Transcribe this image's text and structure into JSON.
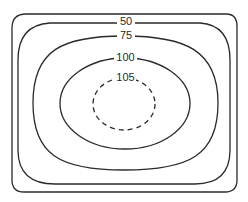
{
  "diagram": {
    "type": "contour-map",
    "frame": {
      "shape": "rounded-rectangle"
    },
    "contours": [
      {
        "value": 50,
        "label": "50",
        "style": "solid"
      },
      {
        "value": 75,
        "label": "75",
        "style": "solid"
      },
      {
        "value": 100,
        "label": "100",
        "style": "solid"
      },
      {
        "value": 105,
        "label": "105",
        "style": "dashed"
      }
    ],
    "colors": {
      "line": "#2a2a2a",
      "background": "#ffffff"
    }
  }
}
